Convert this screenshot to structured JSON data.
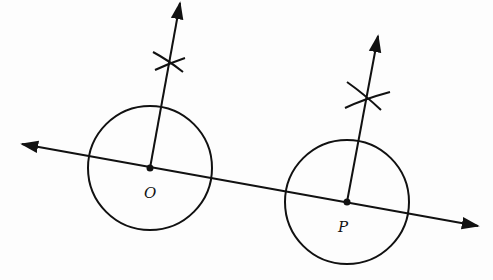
{
  "diagram": {
    "type": "geometric-construction",
    "labels": {
      "point_o": "O",
      "point_p": "P"
    },
    "stroke_color": "#111111",
    "background": "#fdfdfd",
    "elements": {
      "line": {
        "from": [
          22,
          144
        ],
        "to": [
          478,
          226
        ],
        "arrows": "both"
      },
      "circle_o": {
        "center": [
          150,
          168
        ],
        "radius": 62
      },
      "circle_p": {
        "center": [
          347,
          202
        ],
        "radius": 62
      },
      "perpendicular_o": {
        "from": [
          150,
          168
        ],
        "to": [
          180,
          2
        ],
        "arc_mark": [
          168,
          62
        ]
      },
      "perpendicular_p": {
        "from": [
          347,
          202
        ],
        "to": [
          378,
          35
        ],
        "arc_mark": [
          366,
          97
        ]
      }
    }
  }
}
